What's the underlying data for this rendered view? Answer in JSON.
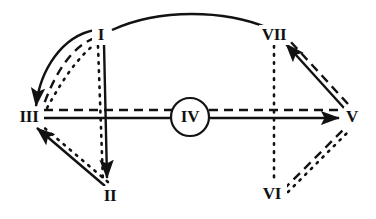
{
  "diagram": {
    "background_color": "#ffffff",
    "ink_color": "#121212",
    "width": 376,
    "height": 219,
    "nodes": [
      {
        "id": "I",
        "label": "I",
        "x": 101,
        "y": 35,
        "circled": false
      },
      {
        "id": "II",
        "label": "II",
        "x": 110,
        "y": 196,
        "circled": false
      },
      {
        "id": "III",
        "label": "III",
        "x": 29,
        "y": 117,
        "circled": false
      },
      {
        "id": "IV",
        "label": "IV",
        "x": 190,
        "y": 117,
        "circled": true
      },
      {
        "id": "V",
        "label": "V",
        "x": 352,
        "y": 117,
        "circled": false
      },
      {
        "id": "VI",
        "label": "VI",
        "x": 272,
        "y": 194,
        "circled": false
      },
      {
        "id": "VII",
        "label": "VII",
        "x": 274,
        "y": 35,
        "circled": false
      }
    ],
    "node_circle_radius": 19,
    "edges": [
      {
        "from": "I",
        "to": "VII",
        "style": "solid",
        "arrow": "none",
        "curved": true
      },
      {
        "from": "I",
        "to": "III",
        "style": "solid",
        "arrow": "target",
        "curved": true
      },
      {
        "from": "I",
        "to": "III",
        "style": "dashed",
        "arrow": "none",
        "curved": true
      },
      {
        "from": "I",
        "to": "III",
        "style": "dotted",
        "arrow": "none",
        "curved": true
      },
      {
        "from": "I",
        "to": "II",
        "style": "solid",
        "arrow": "target",
        "curved": false
      },
      {
        "from": "I",
        "to": "II",
        "style": "dotted",
        "arrow": "none",
        "curved": false
      },
      {
        "from": "II",
        "to": "III",
        "style": "solid",
        "arrow": "target",
        "curved": false
      },
      {
        "from": "II",
        "to": "III",
        "style": "dotted",
        "arrow": "none",
        "curved": false
      },
      {
        "from": "III",
        "to": "V",
        "style": "solid",
        "arrow": "target",
        "curved": false
      },
      {
        "from": "III",
        "to": "V",
        "style": "dashed",
        "arrow": "none",
        "curved": false
      },
      {
        "from": "V",
        "to": "VII",
        "style": "solid",
        "arrow": "target",
        "curved": false
      },
      {
        "from": "V",
        "to": "VII",
        "style": "dashed",
        "arrow": "none",
        "curved": false
      },
      {
        "from": "VI",
        "to": "V",
        "style": "dashed",
        "arrow": "none",
        "curved": false
      },
      {
        "from": "VI",
        "to": "V",
        "style": "dotted",
        "arrow": "none",
        "curved": false
      },
      {
        "from": "VII",
        "to": "VI",
        "style": "dotted",
        "arrow": "none",
        "curved": false
      }
    ],
    "legend": {
      "solid": "solid line",
      "dashed": "dashed line",
      "dotted": "dotted line",
      "arrow": "arrowhead"
    }
  }
}
